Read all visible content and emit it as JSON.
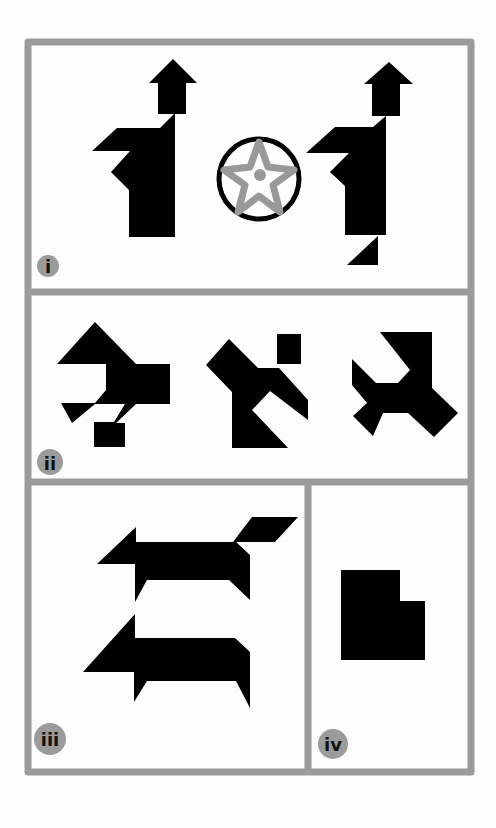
{
  "colors": {
    "frame": "#9b9b9b",
    "shape": "#000000",
    "label_bg": "#9b9b9b",
    "star": "#999999",
    "background": "#fdfdfd"
  },
  "panels": [
    {
      "id": "i",
      "label": "i",
      "content": "two tangram figures (person with arrow/hat) flanking a circled star"
    },
    {
      "id": "ii",
      "label": "ii",
      "content": "three tangram figures"
    },
    {
      "id": "iii",
      "label": "iii",
      "content": "two tangram animal figures"
    },
    {
      "id": "iv",
      "label": "iv",
      "content": "single tangram block shape"
    }
  ]
}
